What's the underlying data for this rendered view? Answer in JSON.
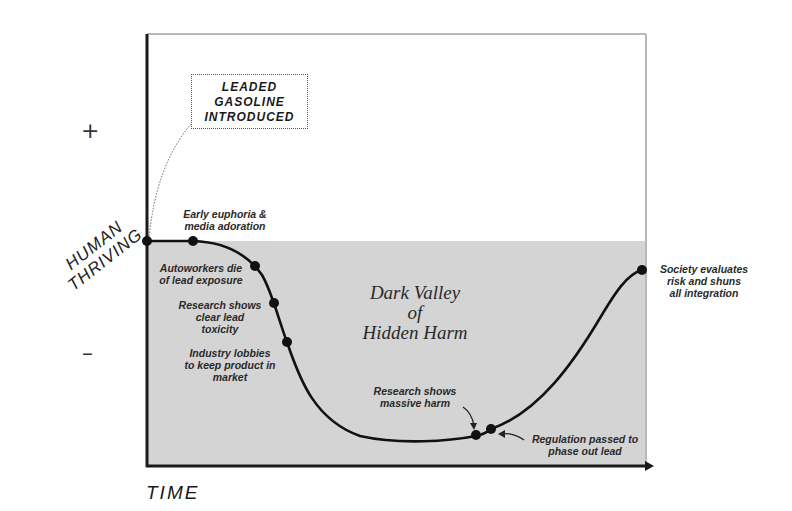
{
  "diagram": {
    "title": "Dark Valley of Hidden Harm",
    "y_axis": {
      "title_lines": [
        "HUMAN",
        "THRIVING"
      ],
      "plus": "+",
      "minus": "–"
    },
    "x_axis": {
      "title": "TIME"
    },
    "intro_box": {
      "lines": [
        "LEADED",
        "GASOLINE",
        "INTRODUCED"
      ]
    },
    "valley_label": {
      "lines": [
        "Dark Valley",
        "of",
        "Hidden Harm"
      ]
    },
    "events": [
      {
        "id": "start",
        "lines": []
      },
      {
        "id": "euphoria",
        "lines": [
          "Early euphoria  &",
          "media adoration"
        ]
      },
      {
        "id": "autoworkers",
        "lines": [
          "Autoworkers die",
          "of lead exposure"
        ]
      },
      {
        "id": "research-toxicity",
        "lines": [
          "Research shows",
          "clear lead",
          "toxicity"
        ]
      },
      {
        "id": "industry-lobbies",
        "lines": [
          "Industry lobbies",
          "to keep product in",
          "market"
        ]
      },
      {
        "id": "research-harm",
        "lines": [
          "Research shows",
          "massive harm"
        ]
      },
      {
        "id": "regulation",
        "lines": [
          "Regulation passed to",
          "phase out lead"
        ]
      },
      {
        "id": "society",
        "lines": [
          "Society evaluates",
          "risk and shuns",
          "all integration"
        ]
      }
    ],
    "colors": {
      "shade": "#d4d4d4",
      "curve": "#111111",
      "axis": "#1a1a1a",
      "frame": "#b8b8b8",
      "text": "#2a2a2a"
    }
  }
}
